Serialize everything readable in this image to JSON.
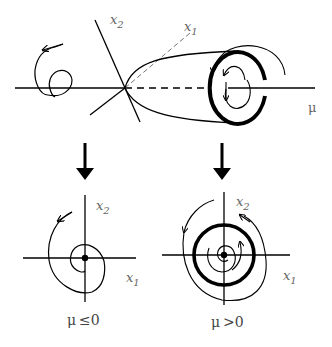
{
  "diagram": {
    "type": "hopf-bifurcation",
    "colors": {
      "stroke": "#000000",
      "label": "#666666",
      "background": "#ffffff"
    },
    "top": {
      "axis_mu_label": "μ",
      "axis_x1_label": "x",
      "axis_x1_sub": "1",
      "axis_x2_label": "x",
      "axis_x2_sub": "2",
      "limit_cycle": "stable-limit-cycle-circle"
    },
    "arrows": [
      {
        "name": "left-down-arrow"
      },
      {
        "name": "right-down-arrow"
      }
    ],
    "panels": [
      {
        "id": "mu-le-0",
        "x1_label": "x",
        "x1_sub": "1",
        "x2_label": "x",
        "x2_sub": "2",
        "caption_mu": "μ",
        "caption_rel": "≤",
        "caption_val": "0",
        "behavior": "stable focus"
      },
      {
        "id": "mu-gt-0",
        "x1_label": "x",
        "x1_sub": "1",
        "x2_label": "x",
        "x2_sub": "2",
        "caption_mu": "μ",
        "caption_rel": ">",
        "caption_val": "0",
        "behavior": "stable limit cycle"
      }
    ]
  }
}
